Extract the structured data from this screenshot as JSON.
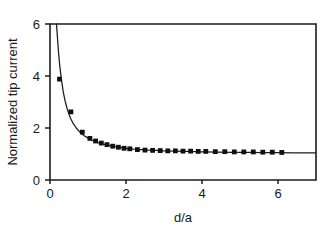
{
  "chart_data": {
    "type": "line",
    "title": "",
    "subtitle": "",
    "xlabel": "d/a",
    "ylabel": "Normalized tip current",
    "xlim": [
      0,
      7
    ],
    "ylim": [
      0,
      6
    ],
    "xticks": [
      0,
      2,
      4,
      6
    ],
    "yticks": [
      0,
      2,
      4,
      6
    ],
    "xtick_labels": [
      "0",
      "2",
      "4",
      "6"
    ],
    "ytick_labels": [
      "0",
      "2",
      "4",
      "6"
    ],
    "grid": false,
    "legend": null,
    "annotations": [],
    "series": [
      {
        "name": "theoretical curve",
        "style": "line",
        "x": [
          0.17,
          0.2,
          0.23,
          0.26,
          0.3,
          0.35,
          0.4,
          0.45,
          0.5,
          0.55,
          0.6,
          0.7,
          0.8,
          0.9,
          1.0,
          1.1,
          1.2,
          1.3,
          1.4,
          1.5,
          1.6,
          1.8,
          2.0,
          2.2,
          2.4,
          2.6,
          2.8,
          3.0,
          3.3,
          3.6,
          4.0,
          4.4,
          4.8,
          5.2,
          5.6,
          6.0,
          6.4,
          7.0
        ],
        "y": [
          6.0,
          5.4,
          4.8,
          4.35,
          3.87,
          3.38,
          3.02,
          2.75,
          2.53,
          2.35,
          2.2,
          1.98,
          1.82,
          1.7,
          1.61,
          1.53,
          1.47,
          1.42,
          1.38,
          1.34,
          1.31,
          1.26,
          1.22,
          1.19,
          1.17,
          1.15,
          1.14,
          1.12,
          1.11,
          1.1,
          1.08,
          1.07,
          1.06,
          1.06,
          1.05,
          1.05,
          1.04,
          1.04
        ]
      },
      {
        "name": "experimental data",
        "style": "markers",
        "marker": "square",
        "x": [
          0.25,
          0.55,
          0.85,
          1.05,
          1.2,
          1.35,
          1.5,
          1.65,
          1.8,
          1.95,
          2.1,
          2.3,
          2.5,
          2.7,
          2.9,
          3.1,
          3.3,
          3.5,
          3.7,
          3.9,
          4.1,
          4.35,
          4.6,
          4.85,
          5.1,
          5.35,
          5.6,
          5.85,
          6.1
        ],
        "y": [
          3.88,
          2.62,
          1.84,
          1.6,
          1.5,
          1.42,
          1.36,
          1.3,
          1.26,
          1.22,
          1.2,
          1.17,
          1.15,
          1.14,
          1.13,
          1.12,
          1.12,
          1.11,
          1.11,
          1.1,
          1.1,
          1.09,
          1.09,
          1.08,
          1.08,
          1.08,
          1.07,
          1.07,
          1.06
        ]
      }
    ]
  },
  "colors": {
    "background": "#ffffff",
    "axis": "#1c1c1c",
    "curve": "#1c1c1c",
    "marker": "#101010",
    "text": "#1a1a1a"
  }
}
